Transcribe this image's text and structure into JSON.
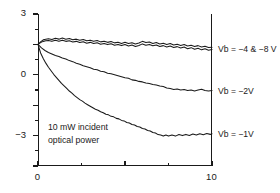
{
  "chart_data": {
    "type": "line",
    "title": "",
    "xlabel": "",
    "ylabel": "",
    "xlim": [
      0,
      20
    ],
    "ylim": [
      -12,
      3
    ],
    "grid": false,
    "legend_position": "right-of-axes",
    "x_ticks": [
      0,
      10,
      20
    ],
    "x_minor_ticks": [
      5,
      15
    ],
    "y_ticks": [
      3,
      0,
      -3,
      -6,
      -9,
      -12
    ],
    "y_minor_ticks": [
      1.5,
      -1.5,
      -4.5,
      -7.5,
      -10.5
    ],
    "annotations": [
      {
        "name": "optical-power-note",
        "line1": "10 mW incident",
        "line2": "optical power"
      }
    ],
    "series": [
      {
        "name": "Vb = -4 V",
        "label": "Vb = −4 & −8 V",
        "label_y": -0.45,
        "color": "#1a1a1a",
        "points": [
          [
            0.0,
            0.0
          ],
          [
            0.3,
            0.25
          ],
          [
            0.6,
            0.45
          ],
          [
            0.9,
            0.5
          ],
          [
            1.2,
            0.55
          ],
          [
            1.6,
            0.48
          ],
          [
            2.0,
            0.6
          ],
          [
            2.4,
            0.52
          ],
          [
            2.8,
            0.62
          ],
          [
            3.2,
            0.5
          ],
          [
            3.6,
            0.58
          ],
          [
            4.0,
            0.45
          ],
          [
            4.4,
            0.52
          ],
          [
            4.8,
            0.4
          ],
          [
            5.2,
            0.48
          ],
          [
            5.6,
            0.35
          ],
          [
            6.0,
            0.42
          ],
          [
            6.4,
            0.3
          ],
          [
            6.8,
            0.38
          ],
          [
            7.2,
            0.25
          ],
          [
            7.6,
            0.32
          ],
          [
            8.0,
            0.2
          ],
          [
            8.4,
            0.28
          ],
          [
            8.8,
            0.15
          ],
          [
            9.2,
            0.22
          ],
          [
            9.6,
            0.1
          ],
          [
            10.0,
            0.2
          ],
          [
            10.4,
            0.08
          ],
          [
            10.8,
            0.16
          ],
          [
            11.2,
            0.05
          ],
          [
            11.6,
            0.14
          ],
          [
            12.0,
            0.3
          ],
          [
            12.4,
            0.18
          ],
          [
            12.8,
            0.24
          ],
          [
            13.2,
            0.1
          ],
          [
            13.6,
            0.18
          ],
          [
            14.0,
            0.05
          ],
          [
            14.4,
            0.12
          ],
          [
            14.8,
            0.0
          ],
          [
            15.2,
            0.08
          ],
          [
            15.6,
            -0.05
          ],
          [
            16.0,
            0.02
          ],
          [
            16.4,
            -0.1
          ],
          [
            16.8,
            -0.02
          ],
          [
            17.2,
            -0.15
          ],
          [
            17.6,
            -0.08
          ],
          [
            18.0,
            -0.2
          ],
          [
            18.4,
            -0.12
          ],
          [
            18.8,
            -0.25
          ],
          [
            19.2,
            -0.18
          ],
          [
            19.6,
            -0.3
          ],
          [
            20.0,
            -0.28
          ]
        ]
      },
      {
        "name": "Vb = -8 V",
        "label": "",
        "color": "#1a1a1a",
        "points": [
          [
            0.0,
            0.0
          ],
          [
            0.3,
            0.18
          ],
          [
            0.6,
            0.3
          ],
          [
            0.9,
            0.35
          ],
          [
            1.2,
            0.38
          ],
          [
            1.6,
            0.3
          ],
          [
            2.0,
            0.4
          ],
          [
            2.4,
            0.32
          ],
          [
            2.8,
            0.42
          ],
          [
            3.2,
            0.3
          ],
          [
            3.6,
            0.36
          ],
          [
            4.0,
            0.24
          ],
          [
            4.4,
            0.3
          ],
          [
            4.8,
            0.18
          ],
          [
            5.2,
            0.26
          ],
          [
            5.6,
            0.12
          ],
          [
            6.0,
            0.2
          ],
          [
            6.4,
            0.08
          ],
          [
            6.8,
            0.16
          ],
          [
            7.2,
            0.02
          ],
          [
            7.6,
            0.1
          ],
          [
            8.0,
            -0.02
          ],
          [
            8.4,
            0.06
          ],
          [
            8.8,
            -0.08
          ],
          [
            9.2,
            0.0
          ],
          [
            9.6,
            -0.12
          ],
          [
            10.0,
            -0.02
          ],
          [
            10.4,
            -0.15
          ],
          [
            10.8,
            -0.06
          ],
          [
            11.2,
            -0.2
          ],
          [
            11.6,
            -0.1
          ],
          [
            12.0,
            0.05
          ],
          [
            12.4,
            -0.08
          ],
          [
            12.8,
            0.0
          ],
          [
            13.2,
            -0.14
          ],
          [
            13.6,
            -0.05
          ],
          [
            14.0,
            -0.2
          ],
          [
            14.4,
            -0.12
          ],
          [
            14.8,
            -0.26
          ],
          [
            15.2,
            -0.16
          ],
          [
            15.6,
            -0.3
          ],
          [
            16.0,
            -0.22
          ],
          [
            16.4,
            -0.36
          ],
          [
            16.8,
            -0.26
          ],
          [
            17.2,
            -0.42
          ],
          [
            17.6,
            -0.32
          ],
          [
            18.0,
            -0.48
          ],
          [
            18.4,
            -0.38
          ],
          [
            18.8,
            -0.54
          ],
          [
            19.2,
            -0.44
          ],
          [
            19.6,
            -0.58
          ],
          [
            20.0,
            -0.5
          ]
        ]
      },
      {
        "name": "Vb = -2 V",
        "label": "Vb = −2V",
        "label_y": -4.6,
        "color": "#1a1a1a",
        "points": [
          [
            0.0,
            0.0
          ],
          [
            0.4,
            -0.35
          ],
          [
            0.8,
            -0.6
          ],
          [
            1.2,
            -0.8
          ],
          [
            1.6,
            -0.95
          ],
          [
            2.0,
            -1.1
          ],
          [
            2.4,
            -1.2
          ],
          [
            2.8,
            -1.35
          ],
          [
            3.2,
            -1.45
          ],
          [
            3.6,
            -1.6
          ],
          [
            4.0,
            -1.7
          ],
          [
            4.4,
            -1.85
          ],
          [
            4.8,
            -1.95
          ],
          [
            5.2,
            -2.1
          ],
          [
            5.6,
            -2.2
          ],
          [
            6.0,
            -2.3
          ],
          [
            6.4,
            -2.45
          ],
          [
            6.8,
            -2.5
          ],
          [
            7.2,
            -2.65
          ],
          [
            7.6,
            -2.7
          ],
          [
            8.0,
            -2.85
          ],
          [
            8.4,
            -2.9
          ],
          [
            8.8,
            -3.0
          ],
          [
            9.2,
            -3.1
          ],
          [
            9.6,
            -3.2
          ],
          [
            10.0,
            -3.3
          ],
          [
            10.4,
            -3.35
          ],
          [
            10.8,
            -3.5
          ],
          [
            11.2,
            -3.55
          ],
          [
            11.6,
            -3.65
          ],
          [
            12.0,
            -3.7
          ],
          [
            12.4,
            -3.8
          ],
          [
            12.8,
            -3.85
          ],
          [
            13.2,
            -3.95
          ],
          [
            13.6,
            -4.0
          ],
          [
            14.0,
            -4.1
          ],
          [
            14.4,
            -4.15
          ],
          [
            14.8,
            -4.3
          ],
          [
            15.2,
            -4.35
          ],
          [
            15.6,
            -4.45
          ],
          [
            16.0,
            -4.4
          ],
          [
            16.4,
            -4.5
          ],
          [
            16.8,
            -4.45
          ],
          [
            17.2,
            -4.55
          ],
          [
            17.6,
            -4.5
          ],
          [
            18.0,
            -4.6
          ],
          [
            18.4,
            -4.5
          ],
          [
            18.8,
            -4.42
          ],
          [
            19.2,
            -4.55
          ],
          [
            19.6,
            -4.6
          ],
          [
            20.0,
            -4.55
          ]
        ]
      },
      {
        "name": "Vb = -1 V",
        "label": "Vb = −1V",
        "label_y": -8.85,
        "color": "#1a1a1a",
        "points": [
          [
            0.0,
            0.0
          ],
          [
            0.3,
            -0.85
          ],
          [
            0.6,
            -1.4
          ],
          [
            0.9,
            -1.85
          ],
          [
            1.2,
            -2.25
          ],
          [
            1.5,
            -2.6
          ],
          [
            1.8,
            -2.95
          ],
          [
            2.1,
            -3.25
          ],
          [
            2.4,
            -3.55
          ],
          [
            2.7,
            -3.85
          ],
          [
            3.0,
            -4.1
          ],
          [
            3.3,
            -4.35
          ],
          [
            3.6,
            -4.6
          ],
          [
            3.9,
            -4.8
          ],
          [
            4.2,
            -5.05
          ],
          [
            4.5,
            -5.25
          ],
          [
            4.8,
            -5.45
          ],
          [
            5.1,
            -5.6
          ],
          [
            5.4,
            -5.8
          ],
          [
            5.7,
            -5.95
          ],
          [
            6.0,
            -6.1
          ],
          [
            6.3,
            -6.25
          ],
          [
            6.6,
            -6.4
          ],
          [
            6.9,
            -6.5
          ],
          [
            7.2,
            -6.65
          ],
          [
            7.5,
            -6.75
          ],
          [
            7.8,
            -6.9
          ],
          [
            8.1,
            -6.95
          ],
          [
            8.4,
            -7.1
          ],
          [
            8.7,
            -7.15
          ],
          [
            9.0,
            -7.3
          ],
          [
            9.3,
            -7.35
          ],
          [
            9.6,
            -7.5
          ],
          [
            9.9,
            -7.55
          ],
          [
            10.2,
            -7.7
          ],
          [
            10.5,
            -7.75
          ],
          [
            10.8,
            -7.9
          ],
          [
            11.1,
            -7.95
          ],
          [
            11.4,
            -8.1
          ],
          [
            11.7,
            -8.15
          ],
          [
            12.0,
            -8.3
          ],
          [
            12.3,
            -8.35
          ],
          [
            12.6,
            -8.5
          ],
          [
            12.9,
            -8.55
          ],
          [
            13.2,
            -8.7
          ],
          [
            13.5,
            -8.75
          ],
          [
            13.8,
            -8.9
          ],
          [
            14.1,
            -8.95
          ],
          [
            14.4,
            -9.05
          ],
          [
            14.7,
            -8.95
          ],
          [
            15.0,
            -9.05
          ],
          [
            15.4,
            -8.95
          ],
          [
            15.8,
            -9.05
          ],
          [
            16.2,
            -8.9
          ],
          [
            16.6,
            -9.0
          ],
          [
            17.0,
            -8.88
          ],
          [
            17.4,
            -8.98
          ],
          [
            17.8,
            -8.85
          ],
          [
            18.2,
            -8.95
          ],
          [
            18.6,
            -8.82
          ],
          [
            19.0,
            -8.92
          ],
          [
            19.4,
            -8.8
          ],
          [
            19.8,
            -8.88
          ],
          [
            20.0,
            -8.82
          ]
        ]
      }
    ]
  }
}
